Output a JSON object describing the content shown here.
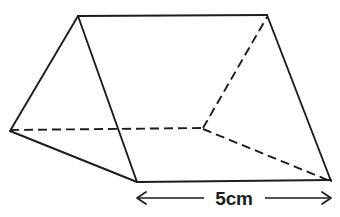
{
  "figure": {
    "shape_name": "triangular-prism",
    "stroke_color": "#1d1d1f",
    "background_color": "#ffffff"
  },
  "dimension": {
    "label": "5cm",
    "value": 5,
    "unit": "cm",
    "measures": "prism-length",
    "left_arrow": "arrow-left",
    "right_arrow": "arrow-right"
  },
  "vertices": {
    "front_apex": {
      "x": 78,
      "y": 16
    },
    "front_left": {
      "x": 10,
      "y": 131
    },
    "front_bottom": {
      "x": 137,
      "y": 182
    },
    "back_apex": {
      "x": 267,
      "y": 16
    },
    "back_left_hidden": {
      "x": 203,
      "y": 129
    },
    "back_bottom": {
      "x": 331,
      "y": 181
    }
  },
  "edges": {
    "solid": [
      {
        "name": "front-apex-to-front-left",
        "from": "front_apex",
        "to": "front_left"
      },
      {
        "name": "front-left-to-front-bottom",
        "from": "front_left",
        "to": "front_bottom"
      },
      {
        "name": "front-bottom-to-front-apex",
        "from": "front_bottom",
        "to": "front_apex"
      },
      {
        "name": "top-ridge",
        "from": "front_apex",
        "to": "back_apex"
      },
      {
        "name": "bottom-edge",
        "from": "front_bottom",
        "to": "back_bottom"
      },
      {
        "name": "back-apex-to-back-bottom",
        "from": "back_apex",
        "to": "back_bottom"
      }
    ],
    "hidden": [
      {
        "name": "hidden-left-edge",
        "from": "front_left",
        "to": "back_left_hidden"
      },
      {
        "name": "hidden-back-upper-edge",
        "from": "back_left_hidden",
        "to": "back_apex"
      },
      {
        "name": "hidden-back-lower-edge",
        "from": "back_left_hidden",
        "to": "back_bottom"
      }
    ]
  }
}
